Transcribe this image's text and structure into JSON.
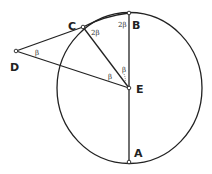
{
  "diagram": {
    "type": "geometry-circle",
    "colors": {
      "stroke": "#222222",
      "background": "#ffffff"
    },
    "points": [
      {
        "id": "A",
        "label": "A"
      },
      {
        "id": "B",
        "label": "B"
      },
      {
        "id": "C",
        "label": "C"
      },
      {
        "id": "D",
        "label": "D"
      },
      {
        "id": "E",
        "label": "E"
      }
    ],
    "segments": [
      "AB",
      "CE",
      "DC",
      "DE",
      "CB"
    ],
    "angles": [
      {
        "at": "D",
        "label": "β"
      },
      {
        "at": "E",
        "between": "DE-CE",
        "label": "β"
      },
      {
        "at": "E",
        "between": "CE-BE",
        "label": "β"
      },
      {
        "at": "C",
        "label": "2β"
      },
      {
        "at": "B",
        "label": "2β"
      }
    ]
  }
}
